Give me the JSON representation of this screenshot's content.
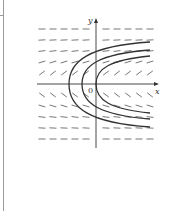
{
  "figure": {
    "type": "slope-field",
    "axes": {
      "x_label": "x",
      "y_label": "y",
      "origin_label": "0"
    },
    "slope_field": {
      "columns_left": [
        42,
        53,
        64,
        75,
        86
      ],
      "columns_right": [
        106,
        117,
        128,
        139,
        150
      ],
      "rows": [
        {
          "y": 29,
          "slope": 0.0
        },
        {
          "y": 40,
          "slope": 0.05
        },
        {
          "y": 51,
          "slope": 0.12
        },
        {
          "y": 62,
          "slope": 0.3
        },
        {
          "y": 73,
          "slope": 0.75
        },
        {
          "y": 95,
          "slope": -0.75
        },
        {
          "y": 106,
          "slope": -0.3
        },
        {
          "y": 117,
          "slope": -0.12
        },
        {
          "y": 128,
          "slope": -0.05
        },
        {
          "y": 139,
          "slope": 0.0
        }
      ]
    },
    "solution_curves": [
      {
        "name": "outer",
        "vertex_x": 69,
        "top_end": [
          150,
          42
        ],
        "bottom_end": [
          150,
          127
        ]
      },
      {
        "name": "middle",
        "vertex_x": 82,
        "top_end": [
          150,
          50
        ],
        "bottom_end": [
          150,
          119
        ]
      },
      {
        "name": "inner",
        "vertex_x": 96,
        "top_end": [
          150,
          56
        ],
        "bottom_end": [
          150,
          113
        ]
      }
    ],
    "colors": {
      "ink": "#333333",
      "slope_marks": "#666666",
      "frame": "#9a9a9a"
    }
  }
}
